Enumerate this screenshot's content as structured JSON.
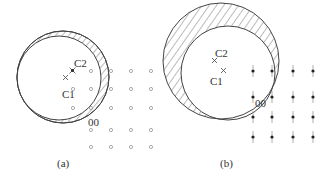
{
  "panels": [
    {
      "id": "a",
      "caption": "(a)",
      "point_labels": {
        "c1": "C1",
        "c2": "C2",
        "origin": "00"
      },
      "lattice": {
        "rows": 5,
        "cols": 4,
        "marker": "open-circle",
        "extra_column_rows": [
          1,
          2
        ]
      }
    },
    {
      "id": "b",
      "caption": "(b)",
      "point_labels": {
        "c1": "C1",
        "c2": "C2",
        "origin": "00"
      },
      "lattice": {
        "rows": 4,
        "cols": 4,
        "marker": "filled-dot-with-streak"
      }
    }
  ],
  "colors": {
    "stroke": "#444444",
    "dot": "#888888",
    "text": "#333333"
  }
}
